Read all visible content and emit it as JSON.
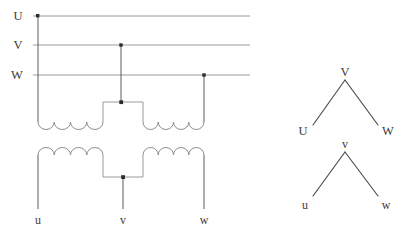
{
  "figure": {
    "background_color": "#ffffff",
    "line_color": "#9a9a9a",
    "label_color": "#3a3a3a",
    "phasor_color": "#4a4a4a",
    "dot_color": "#2b2b2b"
  },
  "primary_terminals": [
    {
      "id": "U",
      "label": "U",
      "label_x": 18,
      "label_y": 20,
      "line_y": 16
    },
    {
      "id": "V",
      "label": "V",
      "label_x": 18,
      "label_y": 49,
      "line_y": 45
    },
    {
      "id": "W",
      "label": "W",
      "label_x": 16,
      "label_y": 79,
      "line_y": 75
    }
  ],
  "bus_lines": {
    "x_start": 33,
    "x_end": 250
  },
  "junction_dots": [
    {
      "name": "dot-u-bus",
      "x": 38,
      "y": 16
    },
    {
      "name": "dot-v-bus",
      "x": 121,
      "y": 45
    },
    {
      "name": "dot-w-bus",
      "x": 204,
      "y": 75
    },
    {
      "name": "dot-upper-bridge",
      "x": 123,
      "y": 102
    },
    {
      "name": "dot-lower-bridge",
      "x": 123,
      "y": 177
    }
  ],
  "secondary_terminals": [
    {
      "id": "u",
      "label": "u",
      "label_x": 36,
      "label_y": 219
    },
    {
      "id": "v",
      "label": "v",
      "label_x": 119,
      "label_y": 219
    },
    {
      "id": "w",
      "label": "w",
      "label_x": 198,
      "label_y": 219
    }
  ],
  "windings": {
    "upper": {
      "arc_count": 4,
      "orientation": "bulge-down",
      "coils": [
        {
          "name": "upper-left-coil",
          "x_start": 38,
          "x_end": 103,
          "y": 122
        },
        {
          "name": "upper-right-coil",
          "x_start": 143,
          "x_end": 204,
          "y": 122
        }
      ],
      "bridge": {
        "x_left": 103,
        "x_right": 143,
        "y_top": 102,
        "y_bottom": 122
      }
    },
    "lower": {
      "arc_count": 4,
      "orientation": "bulge-up",
      "coils": [
        {
          "name": "lower-left-coil",
          "x_start": 38,
          "x_end": 103,
          "y": 155
        },
        {
          "name": "lower-right-coil",
          "x_start": 143,
          "x_end": 204,
          "y": 155
        }
      ],
      "bridge": {
        "x_left": 103,
        "x_right": 143,
        "y_top": 155,
        "y_bottom": 177
      }
    }
  },
  "vector_diagrams": [
    {
      "name": "primary-vector-group",
      "apex": {
        "label": "V",
        "x": 345,
        "y": 80,
        "label_x": 341,
        "label_y": 76
      },
      "left": {
        "label": "U",
        "x": 313,
        "y": 125,
        "label_x": 300,
        "label_y": 134
      },
      "right": {
        "label": "W",
        "x": 378,
        "y": 125,
        "label_x": 382,
        "label_y": 134
      }
    },
    {
      "name": "secondary-vector-group",
      "apex": {
        "label": "v",
        "x": 345,
        "y": 152,
        "label_x": 341,
        "label_y": 149
      },
      "left": {
        "label": "u",
        "x": 313,
        "y": 196,
        "label_x": 302,
        "label_y": 208
      },
      "right": {
        "label": "w",
        "x": 378,
        "y": 196,
        "label_x": 381,
        "label_y": 208
      }
    }
  ]
}
